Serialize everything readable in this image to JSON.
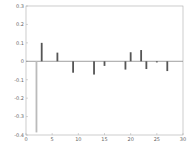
{
  "chart_data": {
    "type": "bar",
    "title": "",
    "xlabel": "",
    "ylabel": "",
    "xlim": [
      0,
      30
    ],
    "ylim": [
      -0.4,
      0.3
    ],
    "grid": false,
    "legend": null,
    "x_ticks": [
      "0",
      "5",
      "10",
      "15",
      "20",
      "25",
      "30"
    ],
    "y_ticks": [
      "0.3",
      "0.2",
      "0.1",
      "0",
      "-0.1",
      "-0.2",
      "-0.3",
      "-0.4"
    ],
    "x": [
      2,
      3,
      6,
      9,
      13,
      15,
      19,
      20,
      22,
      23,
      25,
      27
    ],
    "values": [
      -0.386,
      0.1,
      0.047,
      -0.062,
      -0.072,
      -0.025,
      -0.045,
      0.049,
      0.061,
      -0.042,
      -0.006,
      -0.053
    ],
    "colors": {
      "bar": "#555555",
      "axis": "#999999",
      "zero_line": "#888888"
    }
  }
}
